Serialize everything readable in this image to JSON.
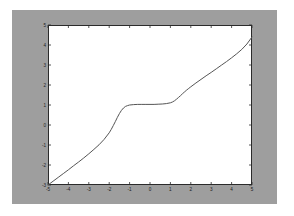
{
  "figure": {
    "background_color": "#9e9e9e",
    "axes_background_color": "#ffffff",
    "axes_border_color": "#2b2b2b",
    "line_color": "#555555"
  },
  "chart_data": {
    "type": "line",
    "title": "",
    "xlabel": "",
    "ylabel": "",
    "xlim": [
      -5,
      5
    ],
    "ylim": [
      -3,
      5
    ],
    "grid": false,
    "legend": null,
    "xticks": [
      -5,
      -4,
      -3,
      -2,
      -1,
      0,
      1,
      2,
      3,
      4,
      5
    ],
    "xtick_labels": [
      "-5",
      "-4",
      "-3",
      "-2",
      "-1",
      "0",
      "1",
      "2",
      "3",
      "4",
      "5"
    ],
    "yticks": [
      -3,
      -2,
      -1,
      0,
      1,
      2,
      3,
      4,
      5
    ],
    "ytick_labels": [
      "-3",
      "-2",
      "-1",
      "0",
      "1",
      "2",
      "3",
      "4",
      "5"
    ],
    "series": [
      {
        "name": "curve",
        "color": "#555555",
        "linewidth": 1,
        "x": [
          -5.0,
          -4.75,
          -4.5,
          -4.25,
          -4.0,
          -3.75,
          -3.5,
          -3.25,
          -3.0,
          -2.75,
          -2.5,
          -2.25,
          -2.0,
          -1.9,
          -1.8,
          -1.7,
          -1.6,
          -1.5,
          -1.4,
          -1.3,
          -1.2,
          -1.1,
          -1.0,
          -0.8,
          -0.6,
          -0.4,
          -0.2,
          0.0,
          0.2,
          0.4,
          0.6,
          0.8,
          1.0,
          1.1,
          1.2,
          1.3,
          1.4,
          1.5,
          1.6,
          1.7,
          1.8,
          1.9,
          2.0,
          2.25,
          2.5,
          2.75,
          3.0,
          3.25,
          3.5,
          3.75,
          4.0,
          4.25,
          4.5,
          4.75,
          5.0
        ],
        "y": [
          -3.0,
          -2.81,
          -2.62,
          -2.43,
          -2.24,
          -2.04,
          -1.85,
          -1.65,
          -1.44,
          -1.22,
          -0.99,
          -0.72,
          -0.39,
          -0.22,
          -0.03,
          0.17,
          0.38,
          0.57,
          0.73,
          0.85,
          0.93,
          0.97,
          1.0,
          1.02,
          1.03,
          1.03,
          1.03,
          1.03,
          1.03,
          1.04,
          1.05,
          1.07,
          1.11,
          1.15,
          1.21,
          1.29,
          1.38,
          1.47,
          1.57,
          1.66,
          1.75,
          1.83,
          1.91,
          2.1,
          2.28,
          2.46,
          2.63,
          2.81,
          2.99,
          3.17,
          3.36,
          3.56,
          3.78,
          4.05,
          4.4
        ]
      }
    ]
  }
}
